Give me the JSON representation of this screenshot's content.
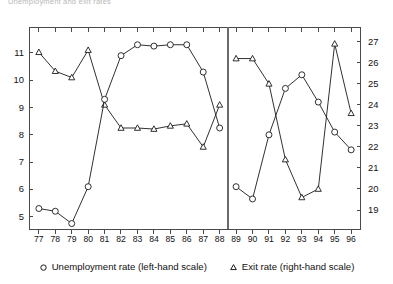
{
  "title": "Unemployment and exit rates",
  "legend": {
    "items": [
      {
        "label": "Unemployment rate (left-hand scale)",
        "marker": "circle-marker-icon"
      },
      {
        "label": "Exit rate (right-hand scale)",
        "marker": "triangle-marker-icon"
      }
    ]
  },
  "chart_data": {
    "type": "line",
    "title": "Unemployment and exit rates",
    "xlabel": "",
    "ylabel": "",
    "grid": false,
    "legend_position": "bottom-center",
    "dual_axis": true,
    "x": [
      "77",
      "78",
      "79",
      "80",
      "81",
      "82",
      "83",
      "84",
      "85",
      "86",
      "87",
      "88",
      "89",
      "90",
      "91",
      "92",
      "93",
      "94",
      "95",
      "96"
    ],
    "xlim": [
      76.4,
      96.6
    ],
    "break_after": "88",
    "axes": {
      "left": {
        "label": "Unemployment rate (left-hand scale)",
        "ylim": [
          4.55,
          11.95
        ],
        "ticks": [
          5,
          6,
          7,
          8,
          9,
          10,
          11
        ],
        "tick_labels": [
          "5",
          "6",
          "7",
          "8",
          "9",
          "10",
          "11"
        ]
      },
      "right": {
        "label": "Exit rate (right-hand scale)",
        "ylim": [
          18.1,
          27.7
        ],
        "ticks": [
          19,
          20,
          21,
          22,
          23,
          24,
          25,
          26,
          27
        ],
        "tick_labels": [
          "19",
          "20",
          "21",
          "22",
          "23",
          "24",
          "25",
          "26",
          "27"
        ]
      }
    },
    "series": [
      {
        "name": "Unemployment rate (left-hand scale)",
        "axis": "left",
        "marker": "circle",
        "segments": [
          {
            "x": [
              "77",
              "78",
              "79",
              "80",
              "81",
              "82",
              "83",
              "84",
              "85",
              "86",
              "87",
              "88"
            ],
            "values": [
              5.3,
              5.2,
              4.75,
              6.1,
              9.3,
              10.9,
              11.3,
              11.25,
              11.3,
              11.3,
              10.3,
              8.25
            ]
          },
          {
            "x": [
              "89",
              "90",
              "91",
              "92",
              "93",
              "94",
              "95",
              "96"
            ],
            "values": [
              6.1,
              5.65,
              8.0,
              9.7,
              10.2,
              9.2,
              8.1,
              7.45
            ]
          }
        ]
      },
      {
        "name": "Exit rate (right-hand scale)",
        "axis": "right",
        "marker": "triangle",
        "segments": [
          {
            "x": [
              "77",
              "78",
              "79",
              "80",
              "81",
              "82",
              "83",
              "84",
              "85",
              "86",
              "87",
              "88"
            ],
            "values": [
              26.5,
              25.6,
              25.3,
              26.6,
              24.0,
              22.9,
              22.9,
              22.85,
              23.0,
              23.1,
              22.0,
              24.0
            ]
          },
          {
            "x": [
              "89",
              "90",
              "91",
              "92",
              "93",
              "94",
              "95",
              "96"
            ],
            "values": [
              26.2,
              26.2,
              25.0,
              21.4,
              19.6,
              20.0,
              26.9,
              23.6
            ]
          }
        ]
      }
    ]
  }
}
